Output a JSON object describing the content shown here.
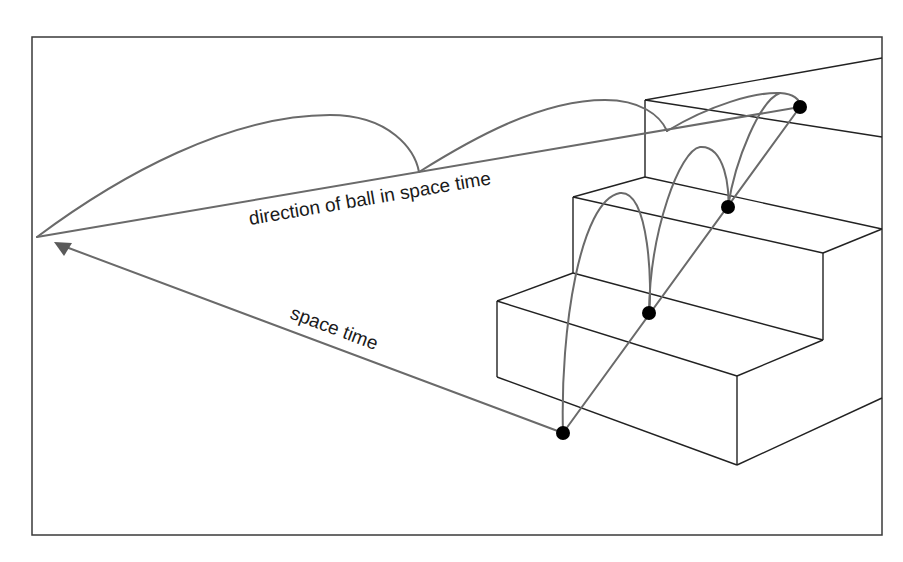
{
  "figure": {
    "labels": {
      "direction": "direction of ball in space time",
      "space_time": "space time"
    },
    "colors": {
      "background": "#ffffff",
      "frame": "#3a3a3a",
      "stairs": "#222222",
      "trajectory": "#6a6a6a",
      "ball": "#000000"
    },
    "balls": [
      {
        "id": "ball-1",
        "x": 563,
        "y": 433
      },
      {
        "id": "ball-2",
        "x": 649,
        "y": 313
      },
      {
        "id": "ball-3",
        "x": 728,
        "y": 207
      },
      {
        "id": "ball-4",
        "x": 800,
        "y": 107
      }
    ],
    "elements": [
      "frame",
      "staircase",
      "ball-trajectory-arcs",
      "projected-arcs",
      "direction-line",
      "space-time-arrow"
    ]
  }
}
